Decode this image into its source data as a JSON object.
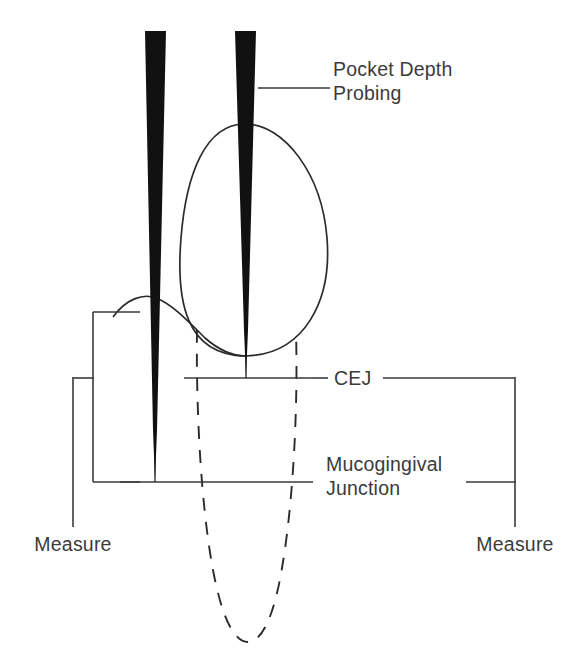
{
  "figure": {
    "background_color": "#ffffff",
    "ink_color": "#2b2b2b",
    "probe_color": "#111111",
    "width": 583,
    "height": 669
  },
  "labels": {
    "pocket_depth_line1": "Pocket Depth",
    "pocket_depth_line2": "Probing",
    "cej": "CEJ",
    "mucogingival_line1": "Mucogingival",
    "mucogingival_line2": "Junction",
    "measure_left": "Measure",
    "measure_right": "Measure"
  },
  "annotations": {
    "pocket_depth_leader": "leader-line-to-probe",
    "cej_left_leader": "cej-line-left",
    "cej_right_leader": "cej-line-right-to-bracket",
    "mgj_left_leader": "mgj-line-left",
    "mgj_right_leader": "mgj-line-right-to-bracket"
  },
  "anatomy": {
    "crown": "tooth-crown-oval",
    "root": "tooth-root-dashed-outline",
    "gingival_margin": "gingival-margin-curve",
    "cej_line": "cementoenamel-junction-line",
    "mgj_line": "mucogingival-junction-line"
  },
  "instruments": {
    "probe_left": "periodontal-probe-left",
    "probe_right": "periodontal-probe-right"
  },
  "brackets": {
    "left_measure_bracket": "left-measurement-bracket",
    "right_measure_bracket": "right-measurement-bracket"
  }
}
